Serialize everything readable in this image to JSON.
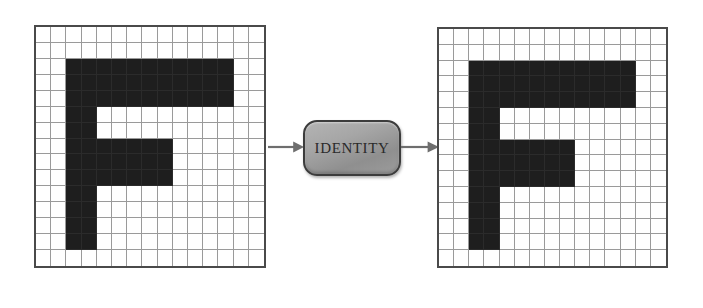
{
  "figure": {
    "type": "transformation-diagram",
    "background_color": "#ffffff"
  },
  "grid_spec": {
    "columns": 15,
    "rows": 15,
    "cell_on_color": "#1e1e1e",
    "cell_off_color": "#ffffff",
    "gridline_color": "#9a9a9a",
    "border_color": "#4a4a4a"
  },
  "panels": [
    {
      "id": "input-grid",
      "name": "input-grid",
      "role": "input",
      "x": 34,
      "y": 25,
      "width": 232,
      "height": 243,
      "glyph": "F",
      "filled_cells": [
        [
          2,
          2
        ],
        [
          3,
          2
        ],
        [
          4,
          2
        ],
        [
          5,
          2
        ],
        [
          6,
          2
        ],
        [
          7,
          2
        ],
        [
          8,
          2
        ],
        [
          9,
          2
        ],
        [
          10,
          2
        ],
        [
          11,
          2
        ],
        [
          12,
          2
        ],
        [
          2,
          3
        ],
        [
          3,
          3
        ],
        [
          4,
          3
        ],
        [
          5,
          3
        ],
        [
          6,
          3
        ],
        [
          7,
          3
        ],
        [
          8,
          3
        ],
        [
          9,
          3
        ],
        [
          10,
          3
        ],
        [
          11,
          3
        ],
        [
          12,
          3
        ],
        [
          2,
          4
        ],
        [
          3,
          4
        ],
        [
          4,
          4
        ],
        [
          5,
          4
        ],
        [
          6,
          4
        ],
        [
          7,
          4
        ],
        [
          8,
          4
        ],
        [
          9,
          4
        ],
        [
          10,
          4
        ],
        [
          11,
          4
        ],
        [
          12,
          4
        ],
        [
          2,
          5
        ],
        [
          3,
          5
        ],
        [
          2,
          6
        ],
        [
          3,
          6
        ],
        [
          2,
          7
        ],
        [
          3,
          7
        ],
        [
          4,
          7
        ],
        [
          5,
          7
        ],
        [
          6,
          7
        ],
        [
          7,
          7
        ],
        [
          8,
          7
        ],
        [
          2,
          8
        ],
        [
          3,
          8
        ],
        [
          4,
          8
        ],
        [
          5,
          8
        ],
        [
          6,
          8
        ],
        [
          7,
          8
        ],
        [
          8,
          8
        ],
        [
          2,
          9
        ],
        [
          3,
          9
        ],
        [
          4,
          9
        ],
        [
          5,
          9
        ],
        [
          6,
          9
        ],
        [
          7,
          9
        ],
        [
          8,
          9
        ],
        [
          2,
          10
        ],
        [
          3,
          10
        ],
        [
          2,
          11
        ],
        [
          3,
          11
        ],
        [
          2,
          12
        ],
        [
          3,
          12
        ],
        [
          2,
          13
        ],
        [
          3,
          13
        ]
      ]
    },
    {
      "id": "output-grid",
      "name": "output-grid",
      "role": "output",
      "x": 437,
      "y": 27,
      "width": 231,
      "height": 241,
      "glyph": "F",
      "filled_cells": [
        [
          2,
          2
        ],
        [
          3,
          2
        ],
        [
          4,
          2
        ],
        [
          5,
          2
        ],
        [
          6,
          2
        ],
        [
          7,
          2
        ],
        [
          8,
          2
        ],
        [
          9,
          2
        ],
        [
          10,
          2
        ],
        [
          11,
          2
        ],
        [
          12,
          2
        ],
        [
          2,
          3
        ],
        [
          3,
          3
        ],
        [
          4,
          3
        ],
        [
          5,
          3
        ],
        [
          6,
          3
        ],
        [
          7,
          3
        ],
        [
          8,
          3
        ],
        [
          9,
          3
        ],
        [
          10,
          3
        ],
        [
          11,
          3
        ],
        [
          12,
          3
        ],
        [
          2,
          4
        ],
        [
          3,
          4
        ],
        [
          4,
          4
        ],
        [
          5,
          4
        ],
        [
          6,
          4
        ],
        [
          7,
          4
        ],
        [
          8,
          4
        ],
        [
          9,
          4
        ],
        [
          10,
          4
        ],
        [
          11,
          4
        ],
        [
          12,
          4
        ],
        [
          2,
          5
        ],
        [
          3,
          5
        ],
        [
          2,
          6
        ],
        [
          3,
          6
        ],
        [
          2,
          7
        ],
        [
          3,
          7
        ],
        [
          4,
          7
        ],
        [
          5,
          7
        ],
        [
          6,
          7
        ],
        [
          7,
          7
        ],
        [
          8,
          7
        ],
        [
          2,
          8
        ],
        [
          3,
          8
        ],
        [
          4,
          8
        ],
        [
          5,
          8
        ],
        [
          6,
          8
        ],
        [
          7,
          8
        ],
        [
          8,
          8
        ],
        [
          2,
          9
        ],
        [
          3,
          9
        ],
        [
          4,
          9
        ],
        [
          5,
          9
        ],
        [
          6,
          9
        ],
        [
          7,
          9
        ],
        [
          8,
          9
        ],
        [
          2,
          10
        ],
        [
          3,
          10
        ],
        [
          2,
          11
        ],
        [
          3,
          11
        ],
        [
          2,
          12
        ],
        [
          3,
          12
        ],
        [
          2,
          13
        ],
        [
          3,
          13
        ]
      ]
    }
  ],
  "operator": {
    "label": "IDENTITY",
    "x": 303,
    "y": 120,
    "width": 98,
    "height": 56,
    "fill_color": "#a0a0a0",
    "border_color": "#3c3c3c",
    "text_color": "#2a2a2a"
  },
  "arrows": [
    {
      "id": "arrow-in",
      "name": "arrow-input-to-operator",
      "x": 268,
      "y": 140,
      "width": 36,
      "color": "#6e6e6e"
    },
    {
      "id": "arrow-out",
      "name": "arrow-operator-to-output",
      "x": 401,
      "y": 140,
      "width": 38,
      "color": "#6e6e6e"
    }
  ]
}
